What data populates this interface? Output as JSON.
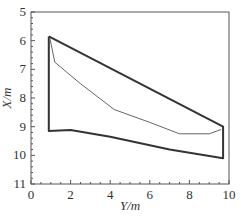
{
  "chart_data": {
    "type": "line",
    "title": "",
    "xlabel": "Y/m",
    "ylabel": "X/m",
    "xlim": [
      0,
      10
    ],
    "ylim": [
      5,
      11
    ],
    "y_inverted": true,
    "grid": false,
    "legend": null,
    "xticks": [
      "0",
      "2",
      "4",
      "6",
      "8",
      "10"
    ],
    "yticks": [
      "5",
      "6",
      "7",
      "8",
      "9",
      "10",
      "11"
    ],
    "series": [
      {
        "name": "outer-boundary",
        "style": "thick",
        "color": "#333333",
        "points": [
          [
            0.9,
            5.85
          ],
          [
            9.7,
            9.0
          ],
          [
            9.7,
            10.1
          ],
          [
            7.0,
            9.8
          ],
          [
            4.0,
            9.35
          ],
          [
            2.0,
            9.12
          ],
          [
            0.9,
            9.15
          ],
          [
            0.9,
            5.85
          ]
        ]
      },
      {
        "name": "inner-curve",
        "style": "thin",
        "color": "#666666",
        "points": [
          [
            0.95,
            5.9
          ],
          [
            1.2,
            6.75
          ],
          [
            2.5,
            7.5
          ],
          [
            4.2,
            8.4
          ],
          [
            6.0,
            8.85
          ],
          [
            7.5,
            9.25
          ],
          [
            9.0,
            9.25
          ],
          [
            9.6,
            9.1
          ]
        ]
      }
    ]
  },
  "axes": {
    "xlabel_prefix": "Y",
    "xlabel_unit": "/m",
    "ylabel_prefix": "X",
    "ylabel_unit": "/m"
  }
}
